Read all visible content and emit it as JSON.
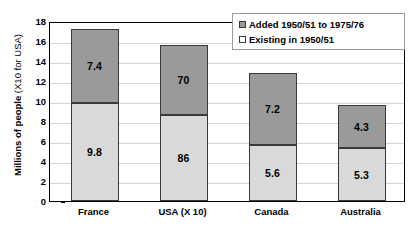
{
  "chart_data": {
    "type": "bar",
    "subtype": "stacked",
    "title": "",
    "xlabel": "",
    "ylabel": "Millions of people (X10 for USA)",
    "ylabel_main": "Millions of people",
    "ylabel_sub": "(X10 for USA)",
    "ylim": [
      0,
      18
    ],
    "ytick_step": 2,
    "yticks": [
      "0",
      "2",
      "4",
      "6",
      "8",
      "10",
      "12",
      "14",
      "16",
      "18"
    ],
    "grid": true,
    "legend_position": "top-right",
    "categories": [
      "France",
      "USA (X 10)",
      "Canada",
      "Australia"
    ],
    "series": [
      {
        "name": "Existing in 1950/51",
        "color": "#d9d9d9",
        "values": [
          9.8,
          8.6,
          5.6,
          5.3
        ],
        "labels": [
          "9.8",
          "86",
          "5.6",
          "5.3"
        ]
      },
      {
        "name": "Added 1950/51 to 1975/76",
        "color": "#9a9a9a",
        "values": [
          7.4,
          7.0,
          7.2,
          4.3
        ],
        "labels": [
          "7.4",
          "70",
          "7.2",
          "4.3"
        ]
      }
    ],
    "totals": [
      17.2,
      15.6,
      12.8,
      9.6
    ]
  },
  "legend": {
    "items": [
      {
        "label": "Added 1950/51 to 1975/76",
        "swatch": "added"
      },
      {
        "label": "Existing in 1950/51",
        "swatch": "existing"
      }
    ]
  }
}
